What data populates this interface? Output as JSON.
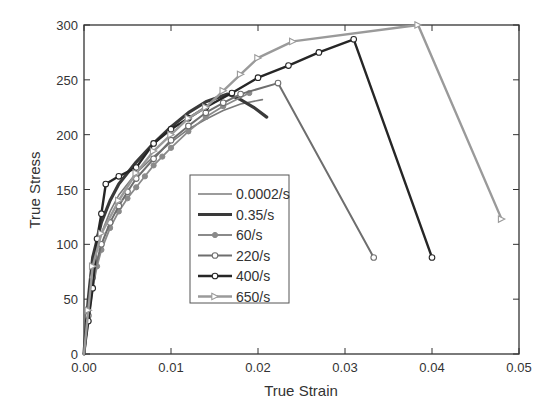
{
  "chart_data": {
    "type": "line",
    "title": "",
    "xlabel": "True Strain",
    "ylabel": "True Stress",
    "xlim": [
      0.0,
      0.05
    ],
    "ylim": [
      0,
      300
    ],
    "xticks": [
      "0.00",
      "0.01",
      "0.02",
      "0.03",
      "0.04",
      "0.05"
    ],
    "yticks": [
      "0",
      "50",
      "100",
      "150",
      "200",
      "250",
      "300"
    ],
    "grid": false,
    "legend_position": "center (inside plot, left-middle)",
    "series": [
      {
        "name": "0.0002/s",
        "color": "#7a7a7a",
        "width": 1.6,
        "marker": "none",
        "x": [
          0,
          0.0005,
          0.001,
          0.002,
          0.003,
          0.004,
          0.006,
          0.008,
          0.01,
          0.012,
          0.014,
          0.016,
          0.018,
          0.0205
        ],
        "y": [
          0,
          45,
          80,
          110,
          130,
          145,
          165,
          180,
          193,
          205,
          214,
          222,
          228,
          232
        ]
      },
      {
        "name": "0.35/s",
        "color": "#3a3a3a",
        "width": 3.2,
        "marker": "none",
        "x": [
          0,
          0.0005,
          0.001,
          0.002,
          0.003,
          0.004,
          0.006,
          0.008,
          0.01,
          0.012,
          0.014,
          0.0165,
          0.018,
          0.0195,
          0.021
        ],
        "y": [
          0,
          50,
          88,
          120,
          140,
          155,
          175,
          192,
          207,
          220,
          230,
          237,
          232,
          225,
          216
        ]
      },
      {
        "name": "60/s",
        "color": "#8a8a8a",
        "width": 1.8,
        "marker": "filled-circle",
        "x": [
          0,
          0.0005,
          0.001,
          0.0015,
          0.002,
          0.003,
          0.004,
          0.005,
          0.006,
          0.007,
          0.008,
          0.009,
          0.01,
          0.012,
          0.014,
          0.016,
          0.019
        ],
        "y": [
          0,
          30,
          60,
          80,
          95,
          115,
          130,
          142,
          152,
          162,
          172,
          180,
          188,
          203,
          216,
          226,
          238
        ]
      },
      {
        "name": "220/s",
        "color": "#6e6e6e",
        "width": 2.0,
        "marker": "open-circle",
        "x": [
          0,
          0.0005,
          0.001,
          0.002,
          0.003,
          0.004,
          0.005,
          0.006,
          0.008,
          0.01,
          0.012,
          0.014,
          0.016,
          0.018,
          0.0223,
          0.0333
        ],
        "y": [
          0,
          35,
          70,
          100,
          120,
          135,
          148,
          160,
          178,
          195,
          208,
          220,
          229,
          237,
          247,
          88
        ]
      },
      {
        "name": "400/s",
        "color": "#262626",
        "width": 2.4,
        "marker": "open-circle",
        "x": [
          0,
          0.0005,
          0.001,
          0.0015,
          0.002,
          0.0025,
          0.004,
          0.006,
          0.008,
          0.01,
          0.012,
          0.014,
          0.017,
          0.02,
          0.0235,
          0.027,
          0.031,
          0.04
        ],
        "y": [
          0,
          30,
          60,
          105,
          128,
          155,
          162,
          170,
          192,
          205,
          215,
          225,
          238,
          252,
          263,
          275,
          287,
          88
        ]
      },
      {
        "name": "650/s",
        "color": "#9a9a9a",
        "width": 2.4,
        "marker": "open-triangle",
        "x": [
          0,
          0.0005,
          0.001,
          0.002,
          0.004,
          0.006,
          0.008,
          0.01,
          0.012,
          0.014,
          0.016,
          0.018,
          0.02,
          0.024,
          0.0384,
          0.048
        ],
        "y": [
          0,
          40,
          80,
          110,
          140,
          165,
          185,
          200,
          215,
          225,
          240,
          255,
          270,
          285,
          300,
          123
        ]
      }
    ]
  },
  "legend": {
    "items": [
      "0.0002/s",
      "0.35/s",
      "60/s",
      "220/s",
      "400/s",
      "650/s"
    ]
  },
  "axes": {
    "xlabel": "True Strain",
    "ylabel": "True Stress"
  }
}
